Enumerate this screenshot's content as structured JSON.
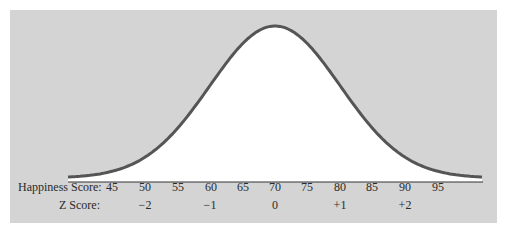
{
  "chart_data": {
    "type": "line",
    "title": "",
    "mean": 70,
    "sd": 10,
    "x": [
      45,
      50,
      55,
      60,
      65,
      70,
      75,
      80,
      85,
      90,
      95
    ],
    "series": [
      {
        "name": "Normal curve (relative density)",
        "values": [
          0.04,
          0.14,
          0.32,
          0.61,
          0.88,
          1.0,
          0.88,
          0.61,
          0.32,
          0.14,
          0.04
        ]
      }
    ],
    "xlabel": "Happiness Score",
    "secondary_axis": {
      "label": "Z Score",
      "ticks": [
        {
          "score": 50,
          "z": "−2"
        },
        {
          "score": 60,
          "z": "−1"
        },
        {
          "score": 70,
          "z": "0"
        },
        {
          "score": 80,
          "z": "+1"
        },
        {
          "score": 90,
          "z": "+2"
        }
      ]
    },
    "grid": false,
    "legend": "none",
    "colors": {
      "background": "#d4d4d4",
      "curve_fill": "#ffffff",
      "curve_line": "#555555",
      "baseline": "#333333"
    }
  },
  "labels": {
    "happiness_row_title": "Happiness Score:",
    "z_row_title": "Z Score:",
    "scores": [
      "45",
      "50",
      "55",
      "60",
      "65",
      "70",
      "75",
      "80",
      "85",
      "90",
      "95"
    ],
    "z_scores": [
      "−2",
      "−1",
      "0",
      "+1",
      "+2"
    ]
  }
}
